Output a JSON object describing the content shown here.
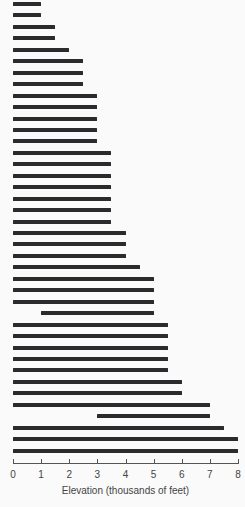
{
  "chart_data": {
    "type": "bar",
    "orientation": "horizontal",
    "title": "",
    "xlabel": "Elevation (thousands of feet)",
    "ylabel": "",
    "xlim": [
      0,
      8
    ],
    "xticks": [
      "0",
      "1",
      "2",
      "3",
      "4",
      "5",
      "6",
      "7",
      "8"
    ],
    "grid": false,
    "legend": null,
    "bar_color": "#2b2b2d",
    "ranges": [
      [
        0,
        1
      ],
      [
        0,
        1
      ],
      [
        0,
        1.5
      ],
      [
        0,
        1.5
      ],
      [
        0,
        2
      ],
      [
        0,
        2.5
      ],
      [
        0,
        2.5
      ],
      [
        0,
        2.5
      ],
      [
        0,
        3
      ],
      [
        0,
        3
      ],
      [
        0,
        3
      ],
      [
        0,
        3
      ],
      [
        0,
        3
      ],
      [
        0,
        3.5
      ],
      [
        0,
        3.5
      ],
      [
        0,
        3.5
      ],
      [
        0,
        3.5
      ],
      [
        0,
        3.5
      ],
      [
        0,
        3.5
      ],
      [
        0,
        3.5
      ],
      [
        0,
        4
      ],
      [
        0,
        4
      ],
      [
        0,
        4
      ],
      [
        0,
        4.5
      ],
      [
        0,
        5
      ],
      [
        0,
        5
      ],
      [
        0,
        5
      ],
      [
        1,
        5
      ],
      [
        0,
        5.5
      ],
      [
        0,
        5.5
      ],
      [
        0,
        5.5
      ],
      [
        0,
        5.5
      ],
      [
        0,
        5.5
      ],
      [
        0,
        6
      ],
      [
        0,
        6
      ],
      [
        0,
        7
      ],
      [
        3,
        7
      ],
      [
        0,
        7.5
      ],
      [
        0,
        8
      ],
      [
        0,
        8
      ]
    ]
  }
}
